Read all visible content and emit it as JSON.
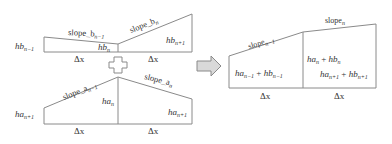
{
  "top_left": {
    "left_height": {
      "main": "hb",
      "sub": "n−1"
    },
    "mid_height": {
      "main": "hb",
      "sub": "n"
    },
    "right_height": {
      "main": "hb",
      "sub": "n+1"
    },
    "slope_left": {
      "main": "slope_b",
      "sub": "n−1"
    },
    "slope_right": {
      "main": "slope_b",
      "sub": "n"
    },
    "dx_left": "Δx",
    "dx_right": "Δx"
  },
  "plus_icon": "plus",
  "bottom_left": {
    "left_height": {
      "main": "ha",
      "sub": "n+1"
    },
    "mid_height": {
      "main": "ha",
      "sub": "n"
    },
    "right_height": {
      "main": "ha",
      "sub": "n+1"
    },
    "slope_left": {
      "main": "slope_a",
      "sub": "n−1"
    },
    "slope_right": {
      "main": "slope_a",
      "sub": "n"
    },
    "dx_left": "Δx",
    "dx_right": "Δx"
  },
  "arrow_icon": "right-arrow",
  "right": {
    "slope_left": {
      "main": "slope",
      "sub": "n−1"
    },
    "slope_right": {
      "main": "slope",
      "sub": "n"
    },
    "sum_left": {
      "a": "ha",
      "a_sub": "n−1",
      "op": " + ",
      "b": "hb",
      "b_sub": "n−1"
    },
    "sum_mid": {
      "a": "ha",
      "a_sub": "n",
      "op": " + ",
      "b": "hb",
      "b_sub": "n"
    },
    "sum_right": {
      "a": "ha",
      "a_sub": "n+1",
      "op": " + ",
      "b": "hb",
      "b_sub": "n+1"
    },
    "dx_left": "Δx",
    "dx_right": "Δx"
  }
}
